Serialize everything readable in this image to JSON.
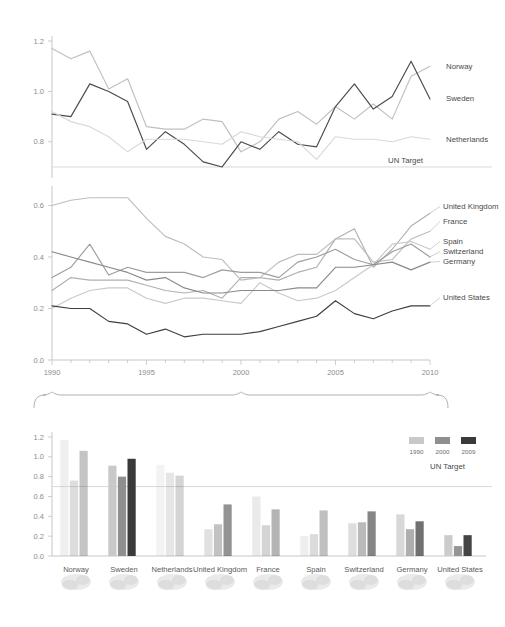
{
  "meta": {
    "figure_name": "oda-gni-chart",
    "background": "#ffffff"
  },
  "colors": {
    "axis": "#b9b9b9",
    "target_line": "#cfcfcf",
    "text": "#4a4a4a",
    "tick_text": "#8d8d8d",
    "brace": "#b0b0b0",
    "bar_1990": "#c9c9c9",
    "bar_2000": "#8f8f8f",
    "bar_2009": "#3a3a3a"
  },
  "top_chart": {
    "yticks": [
      "1.2",
      "1.0",
      "0.8"
    ],
    "target_label": "UN Target",
    "target_value": 0.7,
    "labels": [
      "Norway",
      "Sweden",
      "Netherlands"
    ]
  },
  "middle_chart": {
    "yticks": [
      "0.6",
      "0.4",
      "0.2",
      "0.0"
    ],
    "xticks": [
      "1990",
      "1995",
      "2000",
      "2005",
      "2010"
    ],
    "labels": [
      "United Kingdom",
      "France",
      "Spain",
      "Switzerland",
      "Germany",
      "United States"
    ]
  },
  "bottom_chart": {
    "yticks": [
      "1.2",
      "1.0",
      "0.8",
      "0.6",
      "0.4",
      "0.2",
      "0.0"
    ],
    "target_label": "UN Target",
    "target_value": 0.7,
    "legend": [
      "1990",
      "2000",
      "2009"
    ],
    "categories": [
      "Norway",
      "Sweden",
      "Netherlands",
      "United Kingdom",
      "France",
      "Spain",
      "Switzerland",
      "Germany",
      "United States"
    ]
  },
  "chart_data": [
    {
      "id": "top-line-chart",
      "type": "line",
      "title": "",
      "xlabel": "",
      "ylabel": "",
      "xlim": [
        1990,
        2010
      ],
      "ylim": [
        0.68,
        1.22
      ],
      "grid": false,
      "annotations": [
        {
          "text": "UN Target",
          "y": 0.7,
          "type": "hline"
        }
      ],
      "x": [
        1990,
        1991,
        1992,
        1993,
        1994,
        1995,
        1996,
        1997,
        1998,
        1999,
        2000,
        2001,
        2002,
        2003,
        2004,
        2005,
        2006,
        2007,
        2008,
        2009,
        2010
      ],
      "series": [
        {
          "name": "Norway",
          "color": "#c0c0c0",
          "values": [
            1.17,
            1.13,
            1.16,
            1.01,
            1.05,
            0.86,
            0.85,
            0.85,
            0.89,
            0.88,
            0.76,
            0.8,
            0.89,
            0.92,
            0.87,
            0.94,
            0.89,
            0.95,
            0.89,
            1.06,
            1.1
          ]
        },
        {
          "name": "Sweden",
          "color": "#4a4a4a",
          "values": [
            0.91,
            0.9,
            1.03,
            1.0,
            0.96,
            0.77,
            0.84,
            0.79,
            0.72,
            0.7,
            0.8,
            0.77,
            0.84,
            0.79,
            0.78,
            0.94,
            1.03,
            0.93,
            0.98,
            1.12,
            0.97
          ]
        },
        {
          "name": "Netherlands",
          "color": "#d9d9d9",
          "values": [
            0.92,
            0.88,
            0.86,
            0.82,
            0.76,
            0.81,
            0.81,
            0.81,
            0.8,
            0.79,
            0.84,
            0.82,
            0.81,
            0.8,
            0.73,
            0.82,
            0.81,
            0.81,
            0.8,
            0.82,
            0.81
          ]
        }
      ]
    },
    {
      "id": "middle-line-chart",
      "type": "line",
      "title": "",
      "xlabel": "",
      "ylabel": "",
      "xlim": [
        1990,
        2010
      ],
      "ylim": [
        0.0,
        0.66
      ],
      "grid": false,
      "x": [
        1990,
        1991,
        1992,
        1993,
        1994,
        1995,
        1996,
        1997,
        1998,
        1999,
        2000,
        2001,
        2002,
        2003,
        2004,
        2005,
        2006,
        2007,
        2008,
        2009,
        2010
      ],
      "series": [
        {
          "name": "United Kingdom",
          "color": "#b0b0b0",
          "values": [
            0.27,
            0.32,
            0.31,
            0.31,
            0.31,
            0.29,
            0.27,
            0.26,
            0.27,
            0.24,
            0.32,
            0.32,
            0.31,
            0.34,
            0.36,
            0.47,
            0.51,
            0.36,
            0.43,
            0.52,
            0.57
          ]
        },
        {
          "name": "France",
          "color": "#bdbdbd",
          "values": [
            0.6,
            0.62,
            0.63,
            0.63,
            0.63,
            0.55,
            0.48,
            0.45,
            0.4,
            0.39,
            0.31,
            0.32,
            0.38,
            0.41,
            0.41,
            0.47,
            0.47,
            0.38,
            0.39,
            0.47,
            0.5
          ]
        },
        {
          "name": "Spain",
          "color": "#c9c9c9",
          "values": [
            0.2,
            0.24,
            0.27,
            0.28,
            0.28,
            0.24,
            0.22,
            0.24,
            0.24,
            0.23,
            0.22,
            0.3,
            0.26,
            0.23,
            0.24,
            0.27,
            0.32,
            0.37,
            0.45,
            0.46,
            0.43
          ]
        },
        {
          "name": "Switzerland",
          "color": "#9d9d9d",
          "values": [
            0.32,
            0.36,
            0.45,
            0.33,
            0.36,
            0.34,
            0.34,
            0.34,
            0.32,
            0.35,
            0.34,
            0.34,
            0.32,
            0.38,
            0.4,
            0.43,
            0.39,
            0.37,
            0.42,
            0.45,
            0.4
          ]
        },
        {
          "name": "Germany",
          "color": "#8a8a8a",
          "values": [
            0.42,
            0.4,
            0.38,
            0.36,
            0.34,
            0.31,
            0.32,
            0.28,
            0.26,
            0.26,
            0.27,
            0.27,
            0.27,
            0.28,
            0.28,
            0.36,
            0.36,
            0.37,
            0.38,
            0.35,
            0.38
          ]
        },
        {
          "name": "United States",
          "color": "#3f3f3f",
          "values": [
            0.21,
            0.2,
            0.2,
            0.15,
            0.14,
            0.1,
            0.12,
            0.09,
            0.1,
            0.1,
            0.1,
            0.11,
            0.13,
            0.15,
            0.17,
            0.23,
            0.18,
            0.16,
            0.19,
            0.21,
            0.21
          ]
        }
      ]
    },
    {
      "id": "bottom-bar-chart",
      "type": "bar",
      "title": "",
      "xlabel": "",
      "ylabel": "",
      "ylim": [
        0,
        1.25
      ],
      "grid": false,
      "annotations": [
        {
          "text": "UN Target",
          "y": 0.7,
          "type": "hline"
        }
      ],
      "categories": [
        "Norway",
        "Sweden",
        "Netherlands",
        "United Kingdom",
        "France",
        "Spain",
        "Switzerland",
        "Germany",
        "United States"
      ],
      "series": [
        {
          "name": "1990",
          "color": "#c9c9c9",
          "values": [
            1.17,
            0.91,
            0.92,
            0.27,
            0.6,
            0.2,
            0.33,
            0.42,
            0.21
          ]
        },
        {
          "name": "2000",
          "color": "#8f8f8f",
          "values": [
            0.76,
            0.8,
            0.84,
            0.32,
            0.31,
            0.22,
            0.34,
            0.27,
            0.1
          ]
        },
        {
          "name": "2009",
          "color": "#3a3a3a",
          "values": [
            1.06,
            0.98,
            0.81,
            0.52,
            0.47,
            0.46,
            0.45,
            0.35,
            0.21
          ]
        }
      ],
      "category_opacity": [
        0.3,
        1.0,
        0.22,
        0.55,
        0.38,
        0.32,
        0.62,
        0.72,
        0.95
      ]
    }
  ]
}
